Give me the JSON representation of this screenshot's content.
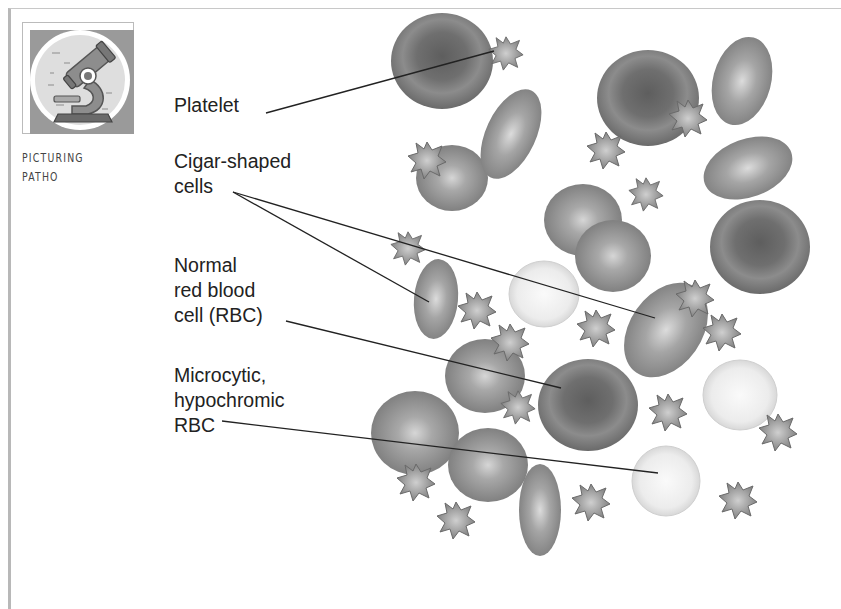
{
  "badge": {
    "icon": "microscope-icon",
    "line1": "PICTURING",
    "line2": "PATHO"
  },
  "labels": {
    "platelet": "Platelet",
    "cigar_l1": "Cigar-shaped",
    "cigar_l2": "cells",
    "normal_l1": "Normal",
    "normal_l2": "red blood",
    "normal_l3": "cell (RBC)",
    "micro_l1": "Microcytic,",
    "micro_l2": "hypochromic",
    "micro_l3": "RBC"
  },
  "colors": {
    "cell_dark": "#6e6e6e",
    "cell_mid": "#8a8a8a",
    "cell_pale": "#e4e4e4",
    "leader_line": "#222222",
    "frame": "#b8b8b8"
  }
}
